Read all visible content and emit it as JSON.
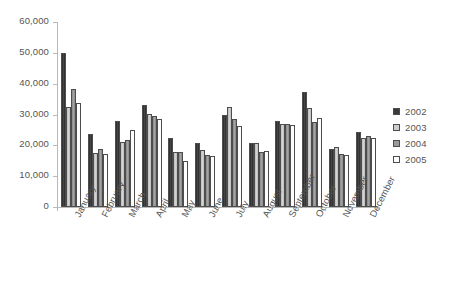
{
  "chart_data": {
    "type": "bar",
    "title": "",
    "subtitle": "",
    "xlabel": "",
    "ylabel": "",
    "ylim": [
      0,
      60000
    ],
    "ytick_labels": [
      "60,000",
      "50,000",
      "40,000",
      "30,000",
      "20,000",
      "10,000",
      "0"
    ],
    "ytick_values": [
      60000,
      50000,
      40000,
      30000,
      20000,
      10000,
      0
    ],
    "grid": false,
    "legend_position": "right",
    "categories": [
      "January",
      "February",
      "March",
      "April",
      "May",
      "June",
      "July",
      "August",
      "September",
      "October",
      "November",
      "December"
    ],
    "series": [
      {
        "name": "2002",
        "color": "#3a3a3a",
        "values": [
          49800,
          23800,
          27800,
          33200,
          22300,
          20700,
          29800,
          20800,
          28000,
          37200,
          18700,
          24200
        ]
      },
      {
        "name": "2003",
        "color": "#cdcdcd",
        "values": [
          32500,
          17600,
          21000,
          30200,
          17700,
          18500,
          32400,
          20600,
          27000,
          32000,
          19400,
          22500
        ]
      },
      {
        "name": "2004",
        "color": "#9a9a9a",
        "values": [
          38300,
          18900,
          21800,
          29400,
          18000,
          17000,
          28600,
          17800,
          27000,
          27700,
          17300,
          23100
        ]
      },
      {
        "name": "2005",
        "color": "#fdfdfd",
        "values": [
          33700,
          17300,
          25000,
          28400,
          14800,
          16700,
          26300,
          18200,
          26500,
          29000,
          17000,
          22300
        ]
      }
    ]
  },
  "legend": {
    "items": [
      {
        "label": "2002",
        "swatch": "s2002"
      },
      {
        "label": "2003",
        "swatch": "s2003"
      },
      {
        "label": "2004",
        "swatch": "s2004"
      },
      {
        "label": "2005",
        "swatch": "s2005"
      }
    ]
  }
}
